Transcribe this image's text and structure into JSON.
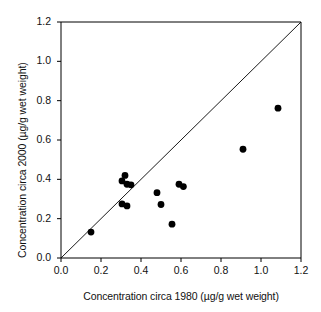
{
  "chart_data": {
    "type": "scatter",
    "title": "",
    "xlabel": "Concentration circa 1980 (µg/g wet weight)",
    "ylabel": "Concentration circa 2000 (µg/g wet weight)",
    "xlim": [
      0.0,
      1.2
    ],
    "ylim": [
      0.0,
      1.2
    ],
    "xticks": [
      "0.0",
      "0.2",
      "0.4",
      "0.6",
      "0.8",
      "1.0",
      "1.2"
    ],
    "yticks": [
      "0.0",
      "0.2",
      "0.4",
      "0.6",
      "0.8",
      "1.0",
      "1.2"
    ],
    "xtick_values": [
      0.0,
      0.2,
      0.4,
      0.6,
      0.8,
      1.0,
      1.2
    ],
    "ytick_values": [
      0.0,
      0.2,
      0.4,
      0.6,
      0.8,
      1.0,
      1.2
    ],
    "grid": false,
    "legend": null,
    "marker": "filled-circle",
    "marker_color": "#000000",
    "axis_color": "#000000",
    "background_color": "#ffffff",
    "reference_line": {
      "name": "one-to-one-line",
      "from": [
        0.0,
        0.0
      ],
      "to": [
        1.2,
        1.2
      ],
      "color": "#000000",
      "style": "solid"
    },
    "series": [
      {
        "name": "stations",
        "points": [
          {
            "x": 0.15,
            "y": 0.132
          },
          {
            "x": 0.305,
            "y": 0.392
          },
          {
            "x": 0.32,
            "y": 0.42
          },
          {
            "x": 0.33,
            "y": 0.375
          },
          {
            "x": 0.35,
            "y": 0.372
          },
          {
            "x": 0.305,
            "y": 0.275
          },
          {
            "x": 0.33,
            "y": 0.265
          },
          {
            "x": 0.48,
            "y": 0.332
          },
          {
            "x": 0.5,
            "y": 0.272
          },
          {
            "x": 0.555,
            "y": 0.172
          },
          {
            "x": 0.59,
            "y": 0.375
          },
          {
            "x": 0.612,
            "y": 0.363
          },
          {
            "x": 0.91,
            "y": 0.553
          },
          {
            "x": 1.085,
            "y": 0.762
          }
        ]
      }
    ]
  },
  "axes": {
    "x_title": "Concentration circa 1980 (µg/g wet weight)",
    "y_title": "Concentration circa 2000 (µg/g wet weight)"
  }
}
